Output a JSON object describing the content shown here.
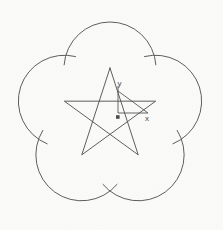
{
  "viewport": {
    "width": 223,
    "height": 230,
    "background_color": "#fbfbfa",
    "line_color": "#4a4a4a",
    "line_width": 0.9,
    "title": "CAD Drawing Viewport"
  },
  "ucs_icon": {
    "name": "ucs-axis-indicator",
    "x_label": "x",
    "y_label": "y",
    "origin_x": 118,
    "origin_y": 113,
    "x_axis_length": 30,
    "y_axis_length": 22,
    "label_color": "#4a4a4a",
    "origin_marker": "filled-square"
  },
  "geometry": {
    "description": "Five circular lobes arranged with 5-fold rotational symmetry, overlaid by a pentagram star polygon connecting the lobe centers.",
    "center_x": 110,
    "center_y": 116,
    "lobe_count": 5,
    "lobe_radius": 46,
    "lobe_center_radius": 48,
    "start_angle_deg": -90,
    "star_step": 2,
    "lobes": [
      {
        "index": 0,
        "angle_deg": -90,
        "cx": 110,
        "cy": 68
      },
      {
        "index": 1,
        "angle_deg": -18,
        "cx": 155.7,
        "cy": 101.2
      },
      {
        "index": 2,
        "angle_deg": 54,
        "cx": 138.2,
        "cy": 154.8
      },
      {
        "index": 3,
        "angle_deg": 126,
        "cx": 81.8,
        "cy": 154.8
      },
      {
        "index": 4,
        "angle_deg": 198,
        "cx": 64.3,
        "cy": 101.2
      }
    ]
  },
  "chart_data": {
    "type": "line",
    "title": "",
    "xlabel": "x",
    "ylabel": "y",
    "series": [
      {
        "name": "lobe-arcs",
        "values": [
          46,
          46,
          46,
          46,
          46
        ]
      },
      {
        "name": "star-polygon",
        "values": [
          48,
          48,
          48,
          48,
          48
        ]
      }
    ],
    "categories": [
      "lobe-0",
      "lobe-1",
      "lobe-2",
      "lobe-3",
      "lobe-4"
    ]
  }
}
